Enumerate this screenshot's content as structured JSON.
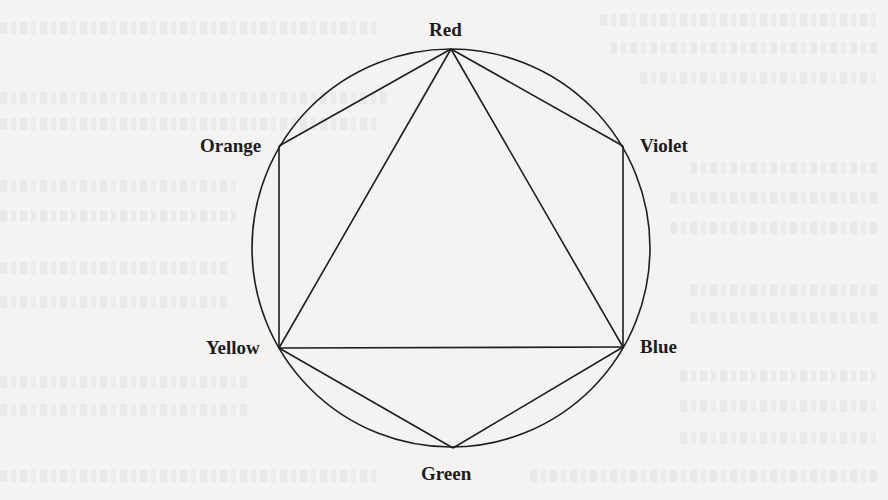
{
  "figure": {
    "type": "color-circle-diagram",
    "circle": {
      "cx": 451,
      "cy": 248,
      "r": 199
    },
    "stroke_color": "#1e1e1e",
    "vertices": [
      {
        "id": "red",
        "label": "Red",
        "x": 451,
        "y": 49
      },
      {
        "id": "violet",
        "label": "Violet",
        "x": 623,
        "y": 146
      },
      {
        "id": "blue",
        "label": "Blue",
        "x": 623,
        "y": 347
      },
      {
        "id": "green",
        "label": "Green",
        "x": 453,
        "y": 448
      },
      {
        "id": "yellow",
        "label": "Yellow",
        "x": 279,
        "y": 348
      },
      {
        "id": "orange",
        "label": "Orange",
        "x": 279,
        "y": 146
      }
    ],
    "edges": [
      [
        "red",
        "violet"
      ],
      [
        "violet",
        "blue"
      ],
      [
        "blue",
        "green"
      ],
      [
        "green",
        "yellow"
      ],
      [
        "yellow",
        "orange"
      ],
      [
        "orange",
        "red"
      ],
      [
        "red",
        "blue"
      ],
      [
        "blue",
        "yellow"
      ],
      [
        "yellow",
        "red"
      ]
    ],
    "labels": {
      "red": "Red",
      "violet": "Violet",
      "blue": "Blue",
      "green": "Green",
      "yellow": "Yellow",
      "orange": "Orange"
    }
  }
}
